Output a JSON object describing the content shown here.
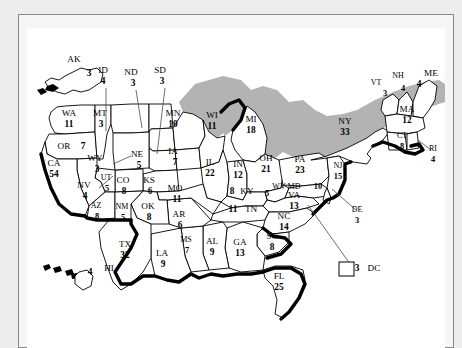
{
  "map": {
    "title": "United States Electoral College Map",
    "lake_color": "#b3b3b3",
    "land_color": "#ffffff",
    "outline_color": "#000000",
    "background_color": "#ededed"
  },
  "chart_data": {
    "type": "map",
    "value_label": "Electoral votes",
    "total": 538,
    "categories": [
      "AK",
      "AL",
      "AR",
      "AZ",
      "CA",
      "CO",
      "CT",
      "DC",
      "DE",
      "FL",
      "GA",
      "HI",
      "IA",
      "ID",
      "IL",
      "IN",
      "KS",
      "KY",
      "LA",
      "MA",
      "MD",
      "ME",
      "MI",
      "MN",
      "MO",
      "MS",
      "MT",
      "NC",
      "ND",
      "NE",
      "NH",
      "NJ",
      "NM",
      "NV",
      "NY",
      "OH",
      "OK",
      "OR",
      "PA",
      "RI",
      "SC",
      "SD",
      "TN",
      "TX",
      "UT",
      "VA",
      "VT",
      "WA",
      "WI",
      "WV",
      "WY"
    ],
    "values": [
      3,
      9,
      6,
      8,
      54,
      8,
      8,
      3,
      3,
      25,
      13,
      4,
      7,
      4,
      22,
      12,
      6,
      8,
      9,
      12,
      10,
      4,
      18,
      10,
      11,
      7,
      3,
      14,
      3,
      5,
      4,
      15,
      5,
      4,
      33,
      21,
      8,
      7,
      23,
      4,
      8,
      3,
      11,
      32,
      5,
      13,
      3,
      11,
      11,
      5,
      3
    ]
  },
  "states": [
    {
      "code": "AK",
      "votes": "3",
      "ab_x": 47,
      "ab_y": 34,
      "nm_x": 62,
      "nm_y": 48,
      "leader": null,
      "inline": false
    },
    {
      "code": "HI",
      "votes": "4",
      "ab_x": 82,
      "ab_y": 243,
      "nm_x": 63,
      "nm_y": 247,
      "leader": null,
      "inline": false
    },
    {
      "code": "WA",
      "votes": "11",
      "ab_x": 42,
      "ab_y": 88,
      "nm_x": 42,
      "nm_y": 99,
      "leader": null,
      "inline": false
    },
    {
      "code": "OR",
      "votes": "7",
      "ab_x": 37,
      "ab_y": 121,
      "nm_x": 56,
      "nm_y": 121,
      "leader": null,
      "inline": true
    },
    {
      "code": "ID",
      "votes": "4",
      "ab_x": 76,
      "ab_y": 45,
      "nm_x": 76,
      "nm_y": 56,
      "leader": "M 79 60 L 79 103",
      "inline": false
    },
    {
      "code": "MT",
      "votes": "3",
      "ab_x": 73,
      "ab_y": 88,
      "nm_x": 74,
      "nm_y": 99,
      "leader": null,
      "inline": false
    },
    {
      "code": "ND",
      "votes": "3",
      "ab_x": 104,
      "ab_y": 47,
      "nm_x": 106,
      "nm_y": 58,
      "leader": "M 109 62 L 115 100",
      "inline": false
    },
    {
      "code": "SD",
      "votes": "3",
      "ab_x": 133,
      "ab_y": 45,
      "nm_x": 135,
      "nm_y": 56,
      "leader": "M 138 60 L 130 126",
      "inline": false
    },
    {
      "code": "MN",
      "votes": "10",
      "ab_x": 146,
      "ab_y": 88,
      "nm_x": 146,
      "nm_y": 99,
      "leader": null,
      "inline": false
    },
    {
      "code": "WI",
      "votes": "11",
      "ab_x": 185,
      "ab_y": 90,
      "nm_x": 185,
      "nm_y": 101,
      "leader": null,
      "inline": false
    },
    {
      "code": "MI",
      "votes": "18",
      "ab_x": 224,
      "ab_y": 94,
      "nm_x": 224,
      "nm_y": 105,
      "leader": null,
      "inline": false
    },
    {
      "code": "WY",
      "votes": "3",
      "ab_x": 68,
      "ab_y": 133,
      "nm_x": 70,
      "nm_y": 144,
      "leader": "M 86 136 L 104 128",
      "inline": false
    },
    {
      "code": "NE",
      "votes": "5",
      "ab_x": 110,
      "ab_y": 129,
      "nm_x": 112,
      "nm_y": 140,
      "leader": null,
      "inline": false
    },
    {
      "code": "IA",
      "votes": "7",
      "ab_x": 146,
      "ab_y": 126,
      "nm_x": 148,
      "nm_y": 137,
      "leader": null,
      "inline": false
    },
    {
      "code": "IL",
      "votes": "22",
      "ab_x": 183,
      "ab_y": 137,
      "nm_x": 183,
      "nm_y": 148,
      "leader": null,
      "inline": false
    },
    {
      "code": "IN",
      "votes": "12",
      "ab_x": 211,
      "ab_y": 139,
      "nm_x": 211,
      "nm_y": 150,
      "leader": null,
      "inline": false
    },
    {
      "code": "OH",
      "votes": "21",
      "ab_x": 239,
      "ab_y": 133,
      "nm_x": 239,
      "nm_y": 144,
      "leader": null,
      "inline": false
    },
    {
      "code": "PA",
      "votes": "23",
      "ab_x": 273,
      "ab_y": 134,
      "nm_x": 273,
      "nm_y": 145,
      "leader": null,
      "inline": false
    },
    {
      "code": "NY",
      "votes": "33",
      "ab_x": 318,
      "ab_y": 96,
      "nm_x": 318,
      "nm_y": 107,
      "leader": null,
      "inline": false
    },
    {
      "code": "VT",
      "votes": "3",
      "ab_x": 349,
      "ab_y": 57,
      "nm_x": 358,
      "nm_y": 68,
      "leader": null,
      "inline": false
    },
    {
      "code": "NH",
      "votes": "4",
      "ab_x": 371,
      "ab_y": 50,
      "nm_x": 376,
      "nm_y": 63,
      "leader": null,
      "inline": false
    },
    {
      "code": "ME",
      "votes": "4",
      "ab_x": 404,
      "ab_y": 48,
      "nm_x": 392,
      "nm_y": 59,
      "leader": null,
      "inline": false
    },
    {
      "code": "MA",
      "votes": "12",
      "ab_x": 380,
      "ab_y": 84,
      "nm_x": 380,
      "nm_y": 95,
      "leader": null,
      "inline": false
    },
    {
      "code": "CT",
      "votes": "8",
      "ab_x": 375,
      "ab_y": 110,
      "nm_x": 375,
      "nm_y": 121,
      "leader": null,
      "inline": false
    },
    {
      "code": "RI",
      "votes": "4",
      "ab_x": 406,
      "ab_y": 123,
      "nm_x": 406,
      "nm_y": 134,
      "leader": "M 404 122 L 391 112",
      "inline": false
    },
    {
      "code": "NJ",
      "votes": "15",
      "ab_x": 311,
      "ab_y": 140,
      "nm_x": 311,
      "nm_y": 151,
      "leader": null,
      "inline": false
    },
    {
      "code": "DE",
      "votes": "3",
      "ab_x": 330,
      "ab_y": 184,
      "nm_x": 330,
      "nm_y": 195,
      "leader": "M 329 182 L 305 161",
      "inline": false
    },
    {
      "code": "MD",
      "votes": "10",
      "ab_x": 267,
      "ab_y": 161,
      "nm_x": 291,
      "nm_y": 161,
      "leader": null,
      "inline": true
    },
    {
      "code": "WV",
      "votes": "5",
      "ab_x": 252,
      "ab_y": 161,
      "nm_x": 240,
      "nm_y": 168,
      "leader": null,
      "inline": false
    },
    {
      "code": "VA",
      "votes": "13",
      "ab_x": 267,
      "ab_y": 170,
      "nm_x": 267,
      "nm_y": 181,
      "leader": null,
      "inline": false
    },
    {
      "code": "NC",
      "votes": "14",
      "ab_x": 257,
      "ab_y": 191,
      "nm_x": 257,
      "nm_y": 202,
      "leader": null,
      "inline": false
    },
    {
      "code": "SC",
      "votes": "8",
      "ab_x": 245,
      "ab_y": 211,
      "nm_x": 245,
      "nm_y": 222,
      "leader": null,
      "inline": false
    },
    {
      "code": "GA",
      "votes": "13",
      "ab_x": 213,
      "ab_y": 217,
      "nm_x": 213,
      "nm_y": 228,
      "leader": null,
      "inline": false
    },
    {
      "code": "FL",
      "votes": "25",
      "ab_x": 252,
      "ab_y": 251,
      "nm_x": 252,
      "nm_y": 262,
      "leader": null,
      "inline": false
    },
    {
      "code": "AL",
      "votes": "9",
      "ab_x": 185,
      "ab_y": 216,
      "nm_x": 185,
      "nm_y": 227,
      "leader": null,
      "inline": false
    },
    {
      "code": "MS",
      "votes": "7",
      "ab_x": 159,
      "ab_y": 214,
      "nm_x": 160,
      "nm_y": 225,
      "leader": null,
      "inline": false
    },
    {
      "code": "LA",
      "votes": "9",
      "ab_x": 135,
      "ab_y": 228,
      "nm_x": 136,
      "nm_y": 239,
      "leader": null,
      "inline": false
    },
    {
      "code": "TX",
      "votes": "32",
      "ab_x": 98,
      "ab_y": 219,
      "nm_x": 98,
      "nm_y": 230,
      "leader": null,
      "inline": false
    },
    {
      "code": "AR",
      "votes": "6",
      "ab_x": 152,
      "ab_y": 189,
      "nm_x": 153,
      "nm_y": 200,
      "leader": null,
      "inline": false
    },
    {
      "code": "OK",
      "votes": "8",
      "ab_x": 121,
      "ab_y": 181,
      "nm_x": 122,
      "nm_y": 192,
      "leader": null,
      "inline": false
    },
    {
      "code": "MO",
      "votes": "11",
      "ab_x": 148,
      "ab_y": 163,
      "nm_x": 150,
      "nm_y": 174,
      "leader": null,
      "inline": false
    },
    {
      "code": "KS",
      "votes": "6",
      "ab_x": 122,
      "ab_y": 155,
      "nm_x": 123,
      "nm_y": 166,
      "leader": null,
      "inline": false
    },
    {
      "code": "KY",
      "votes": "8",
      "ab_x": 220,
      "ab_y": 166,
      "nm_x": 205,
      "nm_y": 166,
      "leader": null,
      "inline": true
    },
    {
      "code": "TN",
      "votes": "11",
      "ab_x": 224,
      "ab_y": 184,
      "nm_x": 206,
      "nm_y": 184,
      "leader": null,
      "inline": true
    },
    {
      "code": "CO",
      "votes": "8",
      "ab_x": 96,
      "ab_y": 155,
      "nm_x": 97,
      "nm_y": 166,
      "leader": null,
      "inline": false
    },
    {
      "code": "UT",
      "votes": "5",
      "ab_x": 79,
      "ab_y": 152,
      "nm_x": 80,
      "nm_y": 163,
      "leader": null,
      "inline": false
    },
    {
      "code": "NV",
      "votes": "4",
      "ab_x": 57,
      "ab_y": 160,
      "nm_x": 58,
      "nm_y": 171,
      "leader": "M 72 160 L 86 148",
      "inline": false
    },
    {
      "code": "CA",
      "votes": "54",
      "ab_x": 27,
      "ab_y": 138,
      "nm_x": 27,
      "nm_y": 149,
      "leader": null,
      "inline": false
    },
    {
      "code": "AZ",
      "votes": "8",
      "ab_x": 69,
      "ab_y": 180,
      "nm_x": 70,
      "nm_y": 191,
      "leader": null,
      "inline": false
    },
    {
      "code": "NM",
      "votes": "5",
      "ab_x": 95,
      "ab_y": 181,
      "nm_x": 96,
      "nm_y": 192,
      "leader": null,
      "inline": false
    },
    {
      "code": "DC",
      "votes": "3",
      "ab_x": 347,
      "ab_y": 243,
      "nm_x": 330,
      "nm_y": 243,
      "leader": "M 326 240 L 281 177",
      "inline": true
    }
  ]
}
